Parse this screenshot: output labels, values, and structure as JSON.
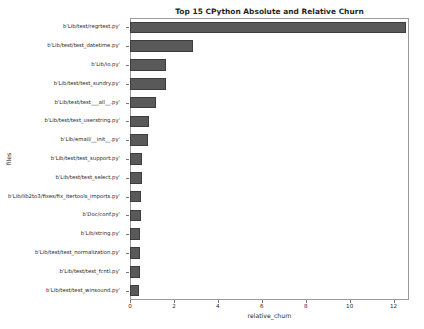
{
  "chart_data": {
    "type": "bar",
    "orientation": "horizontal",
    "title": "Top 15 CPython Absolute and Relative Churn",
    "xlabel": "relative_churn",
    "ylabel": "files",
    "xlim": [
      0,
      12.7
    ],
    "xticks": [
      0,
      2,
      4,
      6,
      8,
      10,
      12
    ],
    "xticklabels": [
      "0",
      "2",
      "4",
      "6",
      "8",
      "10",
      "12"
    ],
    "grid": false,
    "legend": false,
    "bar_color": "#595959",
    "bar_edge_color": "#3d3d3d",
    "categories": [
      "b'Lib/test/regrtest.py'",
      "b'Lib/test/test_datetime.py'",
      "b'Lib/io.py'",
      "b'Lib/test/test_sundry.py'",
      "b'Lib/test/test___all__.py'",
      "b'Lib/test/test_userstring.py'",
      "b'Lib/email/__init__.py'",
      "b'Lib/test/test_support.py'",
      "b'Lib/test/test_select.py'",
      "b'Lib/lib2to3/fixes/fix_itertools_imports.py'",
      "b'Doc/conf.py'",
      "b'Lib/string.py'",
      "b'Lib/test/test_normalization.py'",
      "b'Lib/test/test_fcntl.py'",
      "b'Lib/test/test_winsound.py'"
    ],
    "values": [
      12.55,
      2.85,
      1.65,
      1.62,
      1.2,
      0.88,
      0.82,
      0.56,
      0.54,
      0.5,
      0.49,
      0.47,
      0.46,
      0.44,
      0.43
    ]
  }
}
